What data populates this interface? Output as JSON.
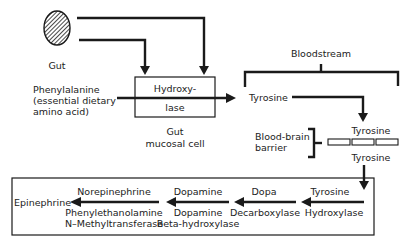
{
  "labels": {
    "gut": "Gut",
    "phenylalanine": "Phenylalanine",
    "phenylalanine_note_1": "(essential dietary",
    "phenylalanine_note_2": "amino acid)",
    "hydroxylase_1": "Hydroxy-",
    "hydroxylase_2": "lase",
    "gut_mucosal_1": "Gut",
    "gut_mucosal_2": "mucosal cell",
    "bloodstream": "Bloodstream",
    "tyrosine_blood": "Tyrosine",
    "bbb_1": "Blood-brain",
    "bbb_2": "barrier",
    "tyrosine_above_barrier": "Tyrosine",
    "tyrosine_below_barrier": "Tyrosine"
  },
  "pathway": {
    "products": [
      "Tyrosine",
      "Dopa",
      "Dopamine",
      "Norepinephrine"
    ],
    "final_product": "Epinephrine",
    "enzymes": [
      [
        "Hydroxylase"
      ],
      [
        "Decarboxylase"
      ],
      [
        "Dopamine",
        "Beta-hydroxylase"
      ],
      [
        "Phenylethanolamine",
        "N–Methyltransferase"
      ]
    ]
  },
  "colors": {
    "ink": "#1a1a1a",
    "background": "#ffffff"
  }
}
